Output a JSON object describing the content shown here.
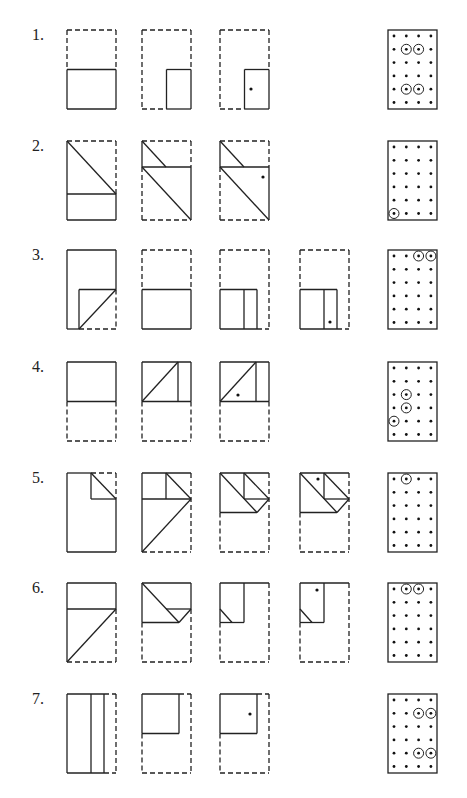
{
  "problems": [
    {
      "label": "1.",
      "answer_circled": [
        [
          1,
          1
        ],
        [
          1,
          2
        ],
        [
          4,
          1
        ],
        [
          4,
          2
        ]
      ]
    },
    {
      "label": "2.",
      "answer_circled": [
        [
          5,
          0
        ]
      ]
    },
    {
      "label": "3.",
      "answer_circled": [
        [
          0,
          2
        ],
        [
          0,
          3
        ]
      ]
    },
    {
      "label": "4.",
      "answer_circled": [
        [
          2,
          1
        ],
        [
          3,
          1
        ],
        [
          4,
          0
        ]
      ]
    },
    {
      "label": "5.",
      "answer_circled": [
        [
          0,
          1
        ]
      ]
    },
    {
      "label": "6.",
      "answer_circled": [
        [
          0,
          1
        ],
        [
          0,
          2
        ]
      ]
    },
    {
      "label": "7.",
      "answer_circled": [
        [
          1,
          2
        ],
        [
          1,
          3
        ],
        [
          4,
          2
        ],
        [
          4,
          3
        ]
      ]
    }
  ],
  "answer_grid": {
    "rows": 6,
    "cols": 4
  }
}
